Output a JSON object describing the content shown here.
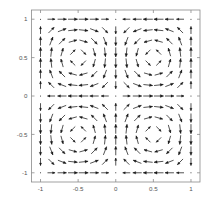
{
  "chart_data": {
    "type": "quiver",
    "title": "",
    "xlabel": "",
    "ylabel": "",
    "xlim": [
      -1.12,
      1.12
    ],
    "ylim": [
      -1.12,
      1.12
    ],
    "grid": false,
    "legend": null,
    "xticks": [
      -1,
      -0.5,
      0,
      0.5,
      1
    ],
    "xticklabels": [
      "-1",
      "-0.5",
      "0",
      "0.5",
      "1"
    ],
    "yticks": [
      -1,
      -0.5,
      0,
      0.5,
      1
    ],
    "yticklabels": [
      "-1",
      "-0.5",
      "0",
      "0.5",
      "1"
    ],
    "frame": true,
    "arrow_color": "#1a1a1a",
    "axis_color": "#8a8a8a",
    "tick_label_color": "#555555",
    "background_color": "#ffffff",
    "grid_nx": 15,
    "grid_ny": 15,
    "grid_x": [
      -1,
      -0.857,
      -0.714,
      -0.571,
      -0.429,
      -0.286,
      -0.143,
      0,
      0.143,
      0.286,
      0.429,
      0.571,
      0.714,
      0.857,
      1
    ],
    "grid_y": [
      -1,
      -0.857,
      -0.714,
      -0.571,
      -0.429,
      -0.286,
      -0.143,
      0,
      0.143,
      0.286,
      0.429,
      0.571,
      0.714,
      0.857,
      1
    ],
    "field": {
      "u_expression": "sin(pi*x)*cos(pi*y)",
      "v_expression": "-cos(pi*x)*sin(pi*y)",
      "description": "Rotational vector field with horizontal arrows along y=0, arrows converging toward interior vortex centers; upper-left arrows point left, upper-right arrows point right, lower half arrows point downward."
    },
    "arrow_scale": 0.082,
    "arrow_head_length": 0.33,
    "arrow_head_width": 0.3
  },
  "axes": {
    "x_tick_labels": [
      "-1",
      "-0.5",
      "0",
      "0.5",
      "1"
    ],
    "y_tick_labels": [
      "-1",
      "-0.5",
      "0",
      "0.5",
      "1"
    ]
  }
}
